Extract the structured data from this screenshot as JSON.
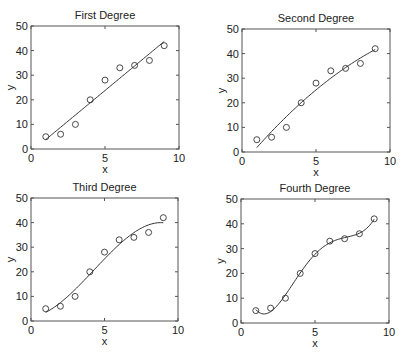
{
  "figure": {
    "background": "#ffffff",
    "axis_color": "#555555",
    "line_color": "#333333",
    "marker_color": "#333333"
  },
  "chart_data": [
    {
      "type": "line",
      "title": "First Degree",
      "xlabel": "x",
      "ylabel": "y",
      "xlim": [
        0,
        10
      ],
      "ylim": [
        0,
        50
      ],
      "xticks": [
        0,
        5,
        10
      ],
      "yticks": [
        0,
        10,
        20,
        30,
        40,
        50
      ],
      "grid": false,
      "degree": 1,
      "series": [
        {
          "name": "data",
          "style": "markers-open-circle",
          "x": [
            1,
            2,
            3,
            4,
            5,
            6,
            7,
            8,
            9
          ],
          "y": [
            5,
            6,
            10,
            20,
            28,
            33,
            34,
            36,
            42
          ]
        },
        {
          "name": "polynomial fit (degree 1)",
          "style": "line",
          "x_range": [
            1,
            9
          ]
        }
      ]
    },
    {
      "type": "line",
      "title": "Second Degree",
      "xlabel": "x",
      "ylabel": "y",
      "xlim": [
        0,
        10
      ],
      "ylim": [
        0,
        50
      ],
      "xticks": [
        0,
        5,
        10
      ],
      "yticks": [
        0,
        10,
        20,
        30,
        40,
        50
      ],
      "grid": false,
      "degree": 2,
      "series": [
        {
          "name": "data",
          "style": "markers-open-circle",
          "x": [
            1,
            2,
            3,
            4,
            5,
            6,
            7,
            8,
            9
          ],
          "y": [
            5,
            6,
            10,
            20,
            28,
            33,
            34,
            36,
            42
          ]
        },
        {
          "name": "polynomial fit (degree 2)",
          "style": "line",
          "x_range": [
            1,
            9
          ]
        }
      ]
    },
    {
      "type": "line",
      "title": "Third Degree",
      "xlabel": "x",
      "ylabel": "y",
      "xlim": [
        0,
        10
      ],
      "ylim": [
        0,
        50
      ],
      "xticks": [
        0,
        5,
        10
      ],
      "yticks": [
        0,
        10,
        20,
        30,
        40,
        50
      ],
      "grid": false,
      "degree": 3,
      "series": [
        {
          "name": "data",
          "style": "markers-open-circle",
          "x": [
            1,
            2,
            3,
            4,
            5,
            6,
            7,
            8,
            9
          ],
          "y": [
            5,
            6,
            10,
            20,
            28,
            33,
            34,
            36,
            42
          ]
        },
        {
          "name": "polynomial fit (degree 3)",
          "style": "line",
          "x_range": [
            1,
            9
          ]
        }
      ]
    },
    {
      "type": "line",
      "title": "Fourth Degree",
      "xlabel": "x",
      "ylabel": "y",
      "xlim": [
        0,
        10
      ],
      "ylim": [
        0,
        50
      ],
      "xticks": [
        0,
        5,
        10
      ],
      "yticks": [
        0,
        10,
        20,
        30,
        40,
        50
      ],
      "grid": false,
      "degree": 4,
      "series": [
        {
          "name": "data",
          "style": "markers-open-circle",
          "x": [
            1,
            2,
            3,
            4,
            5,
            6,
            7,
            8,
            9
          ],
          "y": [
            5,
            6,
            10,
            20,
            28,
            33,
            34,
            36,
            42
          ]
        },
        {
          "name": "polynomial fit (degree 4)",
          "style": "line",
          "x_range": [
            1,
            9
          ]
        }
      ]
    }
  ],
  "layout": {
    "panels": [
      {
        "left": 31,
        "top": 26,
        "right": 179,
        "bottom": 149
      },
      {
        "left": 242,
        "top": 29,
        "right": 390,
        "bottom": 152
      },
      {
        "left": 31,
        "top": 198,
        "right": 178,
        "bottom": 321
      },
      {
        "left": 241,
        "top": 199,
        "right": 389,
        "bottom": 323
      }
    ]
  }
}
